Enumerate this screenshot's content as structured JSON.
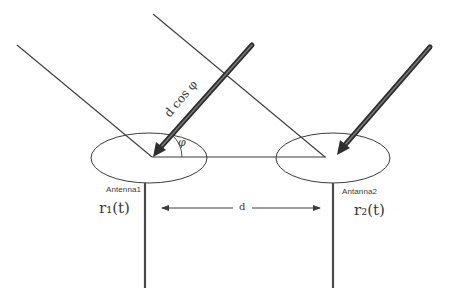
{
  "diagram": {
    "type": "antenna-array-phase-difference",
    "labels": {
      "path_difference": "d cos φ",
      "angle": "φ",
      "antenna1": "Antenna1",
      "antenna2": "Antanna2",
      "signal1": "r₁(t)",
      "signal2": "r₂(t)",
      "spacing": "d"
    },
    "colors": {
      "line": "#3c3c3c",
      "thick_arrow": "#4a4a4a",
      "background": "#ffffff"
    }
  }
}
